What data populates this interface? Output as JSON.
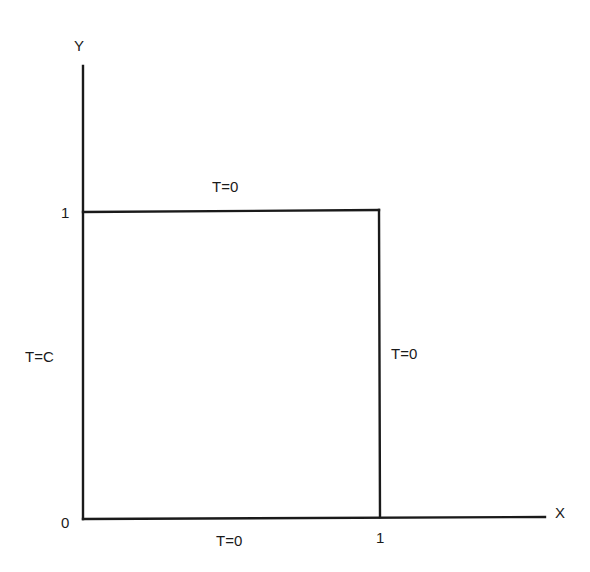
{
  "diagram": {
    "axes": {
      "x_label": "X",
      "y_label": "Y",
      "origin_label": "0",
      "x_tick_label": "1",
      "y_tick_label": "1"
    },
    "boundary_conditions": {
      "top": "T=0",
      "right": "T=0",
      "bottom": "T=0",
      "left": "T=C"
    },
    "colors": {
      "stroke": "#1a1a1a",
      "background": "#ffffff"
    }
  }
}
